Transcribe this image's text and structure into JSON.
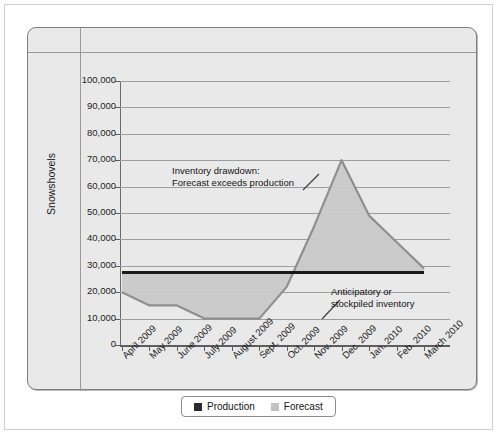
{
  "chart_data": {
    "type": "area",
    "title": "",
    "xlabel": "",
    "ylabel": "Snowshovels",
    "ylim": [
      0,
      100000
    ],
    "grid": true,
    "legend_position": "bottom",
    "categories": [
      "April 2009",
      "May 2009",
      "June 2009",
      "July 2009",
      "August 2009",
      "Sept. 2009",
      "Oct. 2009",
      "Nov. 2009",
      "Dec. 2009",
      "Jan. 2010",
      "Feb. 2010",
      "March 2010"
    ],
    "ytick_labels": [
      "0",
      "10,000",
      "20,000",
      "30,000",
      "40,000",
      "50,000",
      "60,000",
      "70,000",
      "80,000",
      "90,000",
      "100,000"
    ],
    "ytick_values": [
      0,
      10000,
      20000,
      30000,
      40000,
      50000,
      60000,
      70000,
      80000,
      90000,
      100000
    ],
    "series": [
      {
        "name": "Production",
        "type": "line",
        "color": "#1a1a1a",
        "values": [
          27500,
          27500,
          27500,
          27500,
          27500,
          27500,
          27500,
          27500,
          27500,
          27500,
          27500,
          27500
        ]
      },
      {
        "name": "Forecast",
        "type": "area",
        "color": "#c9c9c9",
        "values": [
          20000,
          15000,
          15000,
          10000,
          10000,
          10000,
          22000,
          45000,
          70000,
          49000,
          39000,
          29000
        ]
      }
    ],
    "annotations": [
      {
        "id": "inventory-drawdown",
        "line1": "Inventory drawdown:",
        "line2": "Forecast exceeds production"
      },
      {
        "id": "anticipatory-inventory",
        "line1": "Anticipatory or",
        "line2": "stockpiled inventory"
      }
    ]
  },
  "legend": {
    "items": [
      {
        "label": "Production",
        "color": "#2b2b2b"
      },
      {
        "label": "Forecast",
        "color": "#c2c2c2"
      }
    ]
  }
}
